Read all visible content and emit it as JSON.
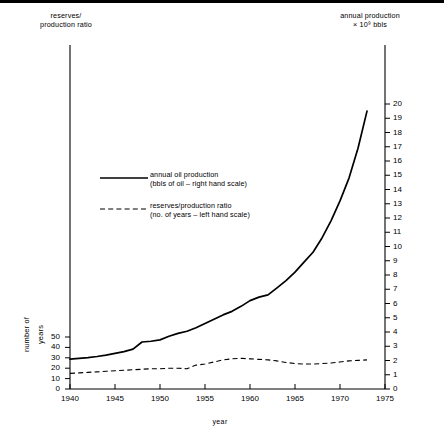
{
  "titles": {
    "left_axis_title": "reserves/\nproduction ratio",
    "left_axis_title_l1": "reserves/",
    "left_axis_title_l2": "production ratio",
    "right_axis_title_l1": "annual production",
    "right_axis_title_l2": "× 10⁹ bbls",
    "x_axis_title": "year",
    "left_axis_rot_l1": "number of",
    "left_axis_rot_l2": "years"
  },
  "legend": {
    "entries": [
      {
        "style": "solid",
        "line1": "annual oil production",
        "line2": "(bbls of oil – right hand scale)"
      },
      {
        "style": "dashed",
        "line1": "reserves/production ratio",
        "line2": "(no. of years – left hand scale)"
      }
    ]
  },
  "chart_data": {
    "type": "line",
    "title": "",
    "xlabel": "year",
    "grid": false,
    "legend_position": "center-left",
    "xlim": [
      1940,
      1975
    ],
    "x_ticks": [
      1940,
      1945,
      1950,
      1955,
      1960,
      1965,
      1970,
      1975
    ],
    "left_axis": {
      "label": "number of years",
      "title": "reserves/production ratio",
      "ylim": [
        0,
        55
      ],
      "ticks": [
        0,
        10,
        20,
        30,
        40,
        50
      ]
    },
    "right_axis": {
      "label": "annual production × 10⁹ bbls",
      "ylim": [
        0,
        20.5
      ],
      "ticks": [
        0,
        1,
        2,
        3,
        4,
        5,
        6,
        7,
        8,
        9,
        10,
        11,
        12,
        13,
        14,
        15,
        16,
        17,
        18,
        19,
        20
      ]
    },
    "series": [
      {
        "name": "annual oil production",
        "axis": "right",
        "style": "solid",
        "units": "10^9 bbls",
        "x": [
          1940,
          1941,
          1942,
          1943,
          1944,
          1945,
          1946,
          1947,
          1948,
          1949,
          1950,
          1951,
          1952,
          1953,
          1954,
          1955,
          1956,
          1957,
          1958,
          1959,
          1960,
          1961,
          1962,
          1963,
          1964,
          1965,
          1966,
          1967,
          1968,
          1969,
          1970,
          1971,
          1972,
          1973
        ],
        "values": [
          2.1,
          2.15,
          2.2,
          2.28,
          2.38,
          2.5,
          2.62,
          2.8,
          3.3,
          3.35,
          3.45,
          3.7,
          3.9,
          4.05,
          4.3,
          4.6,
          4.9,
          5.2,
          5.45,
          5.8,
          6.2,
          6.45,
          6.6,
          7.1,
          7.6,
          8.2,
          8.9,
          9.6,
          10.6,
          11.8,
          13.2,
          14.8,
          16.9,
          19.5
        ]
      },
      {
        "name": "reserves/production ratio",
        "axis": "left",
        "style": "dashed",
        "units": "years",
        "x": [
          1940,
          1941,
          1942,
          1943,
          1944,
          1945,
          1946,
          1947,
          1948,
          1949,
          1950,
          1951,
          1952,
          1953,
          1954,
          1955,
          1956,
          1957,
          1958,
          1959,
          1960,
          1961,
          1962,
          1963,
          1964,
          1965,
          1966,
          1967,
          1968,
          1969,
          1970,
          1971,
          1972,
          1973
        ],
        "values": [
          15,
          15.5,
          16,
          16.5,
          17,
          17.5,
          18,
          18.5,
          19,
          19.5,
          19.5,
          20,
          20,
          19.5,
          23,
          24,
          26,
          28,
          29,
          29.5,
          29,
          28.5,
          28,
          27,
          25.5,
          24.5,
          24,
          24,
          24.5,
          25,
          26,
          27,
          27.5,
          28
        ]
      }
    ]
  }
}
